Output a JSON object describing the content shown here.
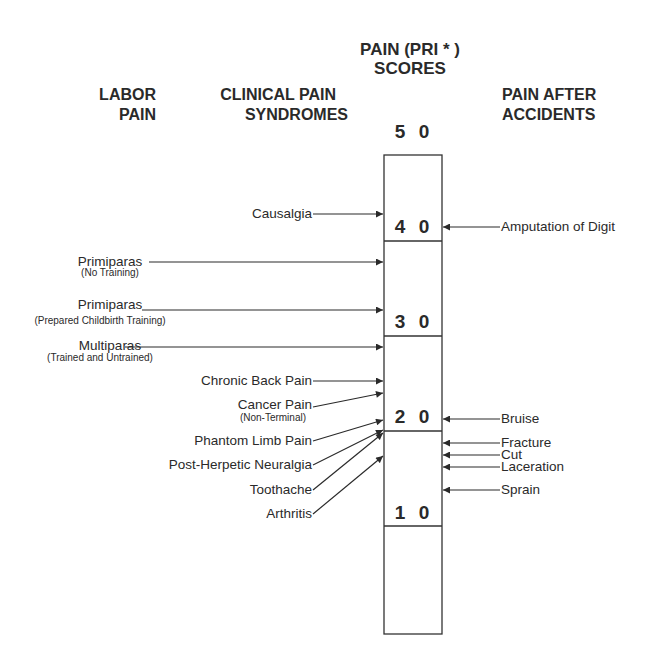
{
  "title": {
    "line1": "PAIN (PRI * )",
    "line2": "SCORES"
  },
  "columns": {
    "labor": {
      "line1": "LABOR",
      "line2": "PAIN"
    },
    "clinical": {
      "line1": "CLINICAL PAIN",
      "line2": "SYNDROMES"
    },
    "accidents": {
      "line1": "PAIN AFTER",
      "line2": "ACCIDENTS"
    }
  },
  "scale": {
    "ticks": [
      "5 0",
      "4 0",
      "3 0",
      "2 0",
      "1 0"
    ],
    "values": [
      50,
      40,
      30,
      20,
      10
    ]
  },
  "labor_items": [
    {
      "label": "Primiparas",
      "sublabel": "(No Training)",
      "score": 35
    },
    {
      "label": "Primiparas",
      "sublabel": "(Prepared Childbirth Training)",
      "score": 30
    },
    {
      "label": "Multiparas",
      "sublabel": "(Trained and Untrained)",
      "score": 26
    }
  ],
  "clinical_items": [
    {
      "label": "Causalgia",
      "sublabel": "",
      "score": 41
    },
    {
      "label": "Chronic Back Pain",
      "sublabel": "",
      "score": 23
    },
    {
      "label": "Cancer Pain",
      "sublabel": "(Non-Terminal)",
      "score": 22
    },
    {
      "label": "Phantom Limb Pain",
      "sublabel": "",
      "score": 21
    },
    {
      "label": "Post-Herpetic Neuralgia",
      "sublabel": "",
      "score": 20
    },
    {
      "label": "Toothache",
      "sublabel": "",
      "score": 18
    },
    {
      "label": "Arthritis",
      "sublabel": "",
      "score": 17
    }
  ],
  "accident_items": [
    {
      "label": "Amputation of Digit",
      "score": 40
    },
    {
      "label": "Bruise",
      "score": 20
    },
    {
      "label": "Fracture",
      "score": 19
    },
    {
      "label": "Cut",
      "score": 18
    },
    {
      "label": "Laceration",
      "score": 17
    },
    {
      "label": "Sprain",
      "score": 15
    }
  ]
}
